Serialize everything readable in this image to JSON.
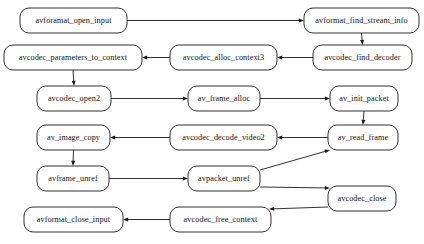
{
  "diagram": {
    "type": "flowchart",
    "background_color": "#ffffff",
    "node_fill": "#ffffff",
    "node_stroke": "#1a1a1a",
    "edge_color": "#1a1a1a",
    "nodes": [
      {
        "id": "avforamat_open_input",
        "label": "avforamat_open_input",
        "x": 20,
        "y": 8,
        "w": 107,
        "h": 25
      },
      {
        "id": "avformat_find_stream_info",
        "label": "avformat_find_stream_info",
        "x": 304,
        "y": 8,
        "w": 115,
        "h": 25
      },
      {
        "id": "avcodec_parameters_to_context",
        "label": "avcodec_parameters_to_context",
        "x": 4,
        "y": 45,
        "w": 138,
        "h": 25
      },
      {
        "id": "avcodec_alloc_context3",
        "label": "avcodec_alloc_context3",
        "x": 170,
        "y": 45,
        "w": 107,
        "h": 25
      },
      {
        "id": "avcodec_find_decoder",
        "label": "avcodec_find_decoder",
        "x": 313,
        "y": 45,
        "w": 99,
        "h": 25
      },
      {
        "id": "avcodec_open2",
        "label": "avcodec_open2",
        "x": 37,
        "y": 86,
        "w": 74,
        "h": 25
      },
      {
        "id": "av_frame_alloc",
        "label": "av_frame_alloc",
        "x": 188,
        "y": 86,
        "w": 72,
        "h": 25
      },
      {
        "id": "av_init_packet",
        "label": "av_init_packet",
        "x": 330,
        "y": 86,
        "w": 68,
        "h": 25
      },
      {
        "id": "av_image_copy",
        "label": "av_image_copy",
        "x": 37,
        "y": 125,
        "w": 73,
        "h": 25
      },
      {
        "id": "avcodec_decode_video2",
        "label": "avcodec_decode_video2",
        "x": 170,
        "y": 125,
        "w": 107,
        "h": 25
      },
      {
        "id": "av_read_frame",
        "label": "av_read_frame",
        "x": 328,
        "y": 125,
        "w": 70,
        "h": 25
      },
      {
        "id": "avframe_unref",
        "label": "avframe_unref",
        "x": 37,
        "y": 166,
        "w": 72,
        "h": 25
      },
      {
        "id": "avpacket_unref",
        "label": "avpacket_unref",
        "x": 188,
        "y": 166,
        "w": 72,
        "h": 25
      },
      {
        "id": "avcodec_close",
        "label": "avcodec_close",
        "x": 328,
        "y": 186,
        "w": 68,
        "h": 25
      },
      {
        "id": "avformat_close_input",
        "label": "avformat_close_input",
        "x": 24,
        "y": 207,
        "w": 99,
        "h": 25
      },
      {
        "id": "avcodec_free_context",
        "label": "avcodec_free_context",
        "x": 170,
        "y": 207,
        "w": 101,
        "h": 25
      }
    ],
    "edges": [
      {
        "from": "avforamat_open_input",
        "to": "avformat_find_stream_info",
        "kind": "horizontal-right"
      },
      {
        "from": "avformat_find_stream_info",
        "to": "avcodec_find_decoder",
        "kind": "vertical-down"
      },
      {
        "from": "avcodec_find_decoder",
        "to": "avcodec_alloc_context3",
        "kind": "horizontal-left"
      },
      {
        "from": "avcodec_alloc_context3",
        "to": "avcodec_parameters_to_context",
        "kind": "horizontal-left"
      },
      {
        "from": "avcodec_parameters_to_context",
        "to": "avcodec_open2",
        "kind": "vertical-down"
      },
      {
        "from": "avcodec_open2",
        "to": "av_frame_alloc",
        "kind": "horizontal-right"
      },
      {
        "from": "av_frame_alloc",
        "to": "av_init_packet",
        "kind": "horizontal-right"
      },
      {
        "from": "av_init_packet",
        "to": "av_read_frame",
        "kind": "vertical-down"
      },
      {
        "from": "av_read_frame",
        "to": "avcodec_decode_video2",
        "kind": "horizontal-left"
      },
      {
        "from": "avcodec_decode_video2",
        "to": "av_image_copy",
        "kind": "horizontal-left"
      },
      {
        "from": "av_image_copy",
        "to": "avframe_unref",
        "kind": "vertical-down"
      },
      {
        "from": "avframe_unref",
        "to": "avpacket_unref",
        "kind": "horizontal-right"
      },
      {
        "from": "avpacket_unref",
        "to": "av_read_frame",
        "kind": "diagonal-up-right"
      },
      {
        "from": "avpacket_unref",
        "to": "avcodec_close",
        "kind": "diagonal-down-right"
      },
      {
        "from": "avcodec_close",
        "to": "avcodec_free_context",
        "kind": "diagonal-down-left"
      },
      {
        "from": "avcodec_free_context",
        "to": "avformat_close_input",
        "kind": "horizontal-left"
      }
    ]
  },
  "caption": {
    "text": ""
  }
}
